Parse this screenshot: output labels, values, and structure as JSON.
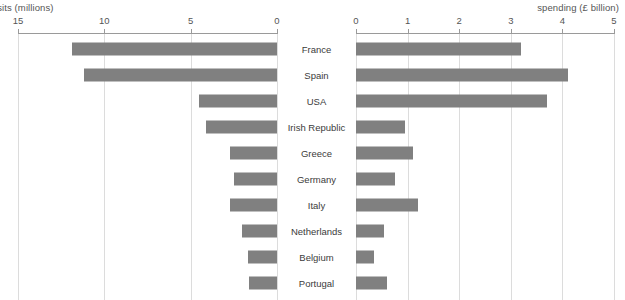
{
  "chart_data": {
    "type": "bar",
    "title": "",
    "orientation": "horizontal-bidirectional",
    "categories": [
      "France",
      "Spain",
      "USA",
      "Irish Republic",
      "Greece",
      "Germany",
      "Italy",
      "Netherlands",
      "Belgium",
      "Portugal"
    ],
    "series": [
      {
        "name": "visits (millions)",
        "axis": "left",
        "direction": "right-to-left",
        "axis_label": "visits (millions)",
        "axis_label_clipped": "isits (millions)",
        "ticks": [
          15,
          10,
          5,
          0
        ],
        "xlim": [
          15,
          0
        ],
        "values": [
          11.9,
          11.2,
          4.5,
          4.1,
          2.7,
          2.5,
          2.7,
          2.0,
          1.7,
          1.6
        ]
      },
      {
        "name": "spending (£ billion)",
        "axis": "right",
        "direction": "left-to-right",
        "axis_label": "spending (£ billion)",
        "ticks": [
          0,
          1,
          2,
          3,
          4,
          5
        ],
        "xlim": [
          0,
          5
        ],
        "values": [
          3.2,
          4.1,
          3.7,
          0.95,
          1.1,
          0.75,
          1.2,
          0.55,
          0.35,
          0.6
        ]
      }
    ],
    "grid": true,
    "legend": "none",
    "bar_color": "#808080",
    "grid_color": "#dcdcdc",
    "axis_color": "#9a9a9a"
  },
  "axes": {
    "left": {
      "caption": "isits (millions)",
      "tick_labels": [
        "15",
        "10",
        "5",
        "0"
      ]
    },
    "right": {
      "caption": "spending (£ billion)",
      "tick_labels": [
        "0",
        "1",
        "2",
        "3",
        "4",
        "5"
      ]
    }
  }
}
